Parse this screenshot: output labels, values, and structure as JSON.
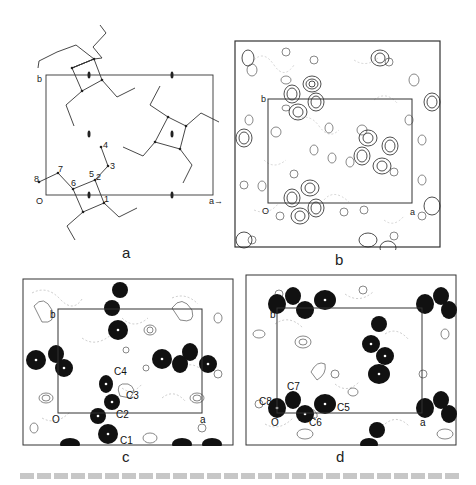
{
  "figure": {
    "panels": [
      {
        "id": "a",
        "label": "a",
        "description": "Molecular packing projection with unit cell and 2-fold screw axes",
        "axes": {
          "origin": "O",
          "a": "a",
          "b": "b"
        },
        "atom_labels": [
          "1",
          "2",
          "3",
          "4",
          "5",
          "6",
          "7",
          "8"
        ]
      },
      {
        "id": "b",
        "label": "b",
        "description": "Electron density contour map",
        "axes": {
          "origin": "O",
          "a": "a",
          "b": "b"
        }
      },
      {
        "id": "c",
        "label": "c",
        "description": "Fourier map with carbon atom labels",
        "axes": {
          "origin": "O",
          "a": "a",
          "b": "b"
        },
        "atom_labels": [
          "C4",
          "C3",
          "C2",
          "C1"
        ]
      },
      {
        "id": "d",
        "label": "d",
        "description": "Fourier map with carbon atom labels",
        "axes": {
          "origin": "O",
          "a": "a",
          "b": "b"
        },
        "atom_labels": [
          "C7",
          "C8",
          "C5",
          "C6"
        ]
      }
    ],
    "colors": {
      "ink": "#1a1a1a",
      "contour": "#555555",
      "dashed": "#999999",
      "background": "#ffffff"
    }
  }
}
